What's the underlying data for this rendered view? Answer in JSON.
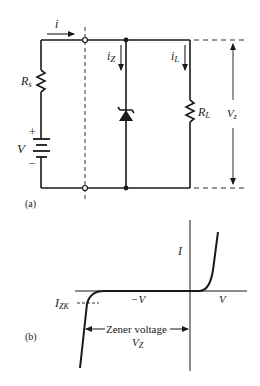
{
  "figure_a": {
    "panel_label": "(a)",
    "current_i": "i",
    "current_iz": "i",
    "current_iz_sub": "Z",
    "current_il": "i",
    "current_il_sub": "L",
    "source_resistor": "R",
    "source_resistor_sub": "s",
    "load_resistor": "R",
    "load_resistor_sub": "L",
    "source_voltage": "V",
    "plus_sign": "+",
    "minus_sign": "−",
    "output_voltage": "V",
    "output_voltage_sub": "z"
  },
  "figure_b": {
    "panel_label": "(b)",
    "axis_current": "I",
    "axis_pos_voltage": "V",
    "axis_neg_voltage": "−V",
    "knee_current": "I",
    "knee_current_sub": "ZK",
    "zener_voltage_label": "Zener voltage",
    "zener_voltage_symbol": "V",
    "zener_voltage_symbol_sub": "Z"
  },
  "colors": {
    "ink": "#1a1a1a",
    "background": "#ffffff"
  }
}
